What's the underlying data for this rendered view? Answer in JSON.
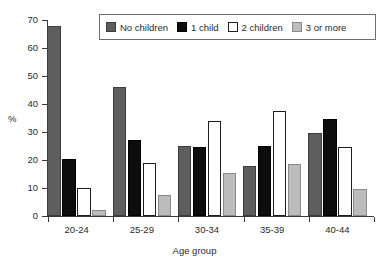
{
  "chart_data": {
    "type": "bar",
    "title": "",
    "xlabel": "Age group",
    "ylabel": "%",
    "categories": [
      "20-24",
      "25-29",
      "30-34",
      "35-39",
      "40-44"
    ],
    "series": [
      {
        "name": "No children",
        "color": "#5e5e5e",
        "values": [
          68,
          46,
          25,
          18,
          29.5
        ]
      },
      {
        "name": "1 child",
        "color": "#0d0d0d",
        "values": [
          20.5,
          27,
          24.5,
          25,
          34.5
        ]
      },
      {
        "name": "2 children",
        "color": "#ffffff",
        "values": [
          10,
          19,
          34,
          37.5,
          24.5
        ]
      },
      {
        "name": "3 or more",
        "color": "#bcbcbc",
        "values": [
          2,
          7.5,
          15.5,
          18.5,
          9.5
        ]
      }
    ],
    "ylim": [
      0,
      70
    ],
    "ytick_labels": [
      "0",
      "10",
      "20",
      "30",
      "40",
      "50",
      "60",
      "70"
    ],
    "ytick_values": [
      0,
      10,
      20,
      30,
      40,
      50,
      60,
      70
    ],
    "grid": false,
    "legend_position": "top-center",
    "legend_boxed": true
  },
  "axes": {
    "y_title": "%",
    "x_title": "Age group"
  }
}
